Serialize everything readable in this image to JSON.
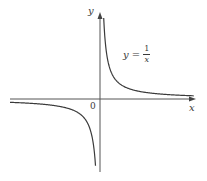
{
  "chart_data": {
    "type": "line",
    "title": "",
    "function": "y = 1/x",
    "xlabel": "x",
    "ylabel": "y",
    "origin_label": "0",
    "annotations": [
      {
        "text": "y = 1/x",
        "position": "upper right of y-axis"
      }
    ],
    "series": [
      {
        "name": "y = 1/x (x > 0)",
        "x": [
          0.05,
          0.1,
          0.25,
          0.5,
          1,
          2,
          4
        ],
        "y": [
          20,
          10,
          4,
          2,
          1,
          0.5,
          0.25
        ]
      },
      {
        "name": "y = 1/x (x < 0)",
        "x": [
          -4,
          -2,
          -1,
          -0.5,
          -0.25,
          -0.1,
          -0.05
        ],
        "y": [
          -0.25,
          -0.5,
          -1,
          -2,
          -4,
          -10,
          -20
        ]
      }
    ],
    "grid": false,
    "legend": "none",
    "axes": {
      "x_arrow": true,
      "y_arrow": true,
      "ticks": false
    }
  },
  "labels": {
    "y_axis": "y",
    "x_axis": "x",
    "origin": "0",
    "equation_lhs": "y =",
    "equation_num": "1",
    "equation_den": "x"
  },
  "colors": {
    "axis": "#555555",
    "curve": "#3a3a3a",
    "background": "#ffffff"
  }
}
